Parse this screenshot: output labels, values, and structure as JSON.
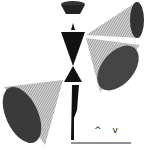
{
  "image": {
    "description": "Abstract engraving-style figure composed of geometric cones and triangles",
    "colors": {
      "ink": "#1a1a1a",
      "paper": "#ffffff",
      "mid": "#555555"
    }
  },
  "marks": {
    "text": "^ v"
  }
}
